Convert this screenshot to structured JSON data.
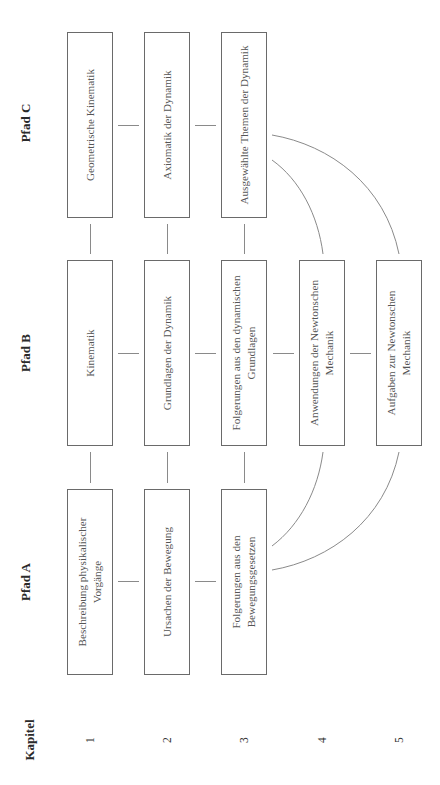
{
  "header": {
    "kapitel_label": "Kapitel",
    "chapters": [
      "1",
      "2",
      "3",
      "4",
      "5"
    ]
  },
  "paths": [
    {
      "label": "Pfad C",
      "boxes": [
        "Geometrische Kinematik",
        "Axiomatik der Dynamik",
        "Ausgewählte Themen der Dynamik"
      ]
    },
    {
      "label": "Pfad B",
      "boxes": [
        "Kinematik",
        "Grundlagen der Dynamik",
        "Folgerungen aus den dynamischen Grundlagen",
        "Anwendungen der Newtonschen Mechanik",
        "Aufgaben zur Newtonschen Mechanik"
      ]
    },
    {
      "label": "Pfad A",
      "boxes": [
        "Beschreibung physikalischer Vorgänge",
        "Ursachen der Bewegung",
        "Folgerungen aus den Bewegungsgesetzen"
      ]
    }
  ],
  "colors": {
    "box_border": "#6a6a6a",
    "box_text": "#555555",
    "connector": "#8a8a8a",
    "label": "#2a2a2a"
  }
}
